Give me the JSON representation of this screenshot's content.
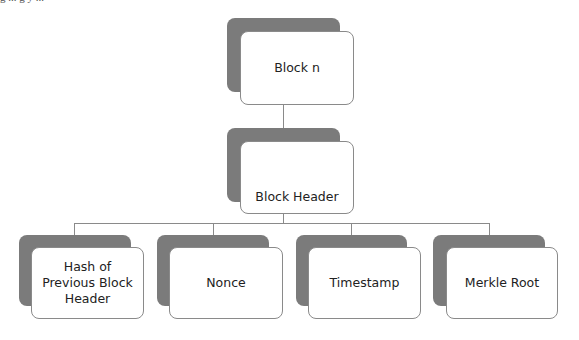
{
  "caption_fragment": "g   ...   g      y   ...",
  "colors": {
    "back_card": "#7b7b7b",
    "front_card": "#ffffff",
    "border": "#8a8a8a",
    "text": "#222222"
  },
  "diagram": {
    "root": {
      "label": "Block n"
    },
    "header": {
      "label": "Block Header"
    },
    "fields": [
      {
        "label": "Hash of Previous Block Header"
      },
      {
        "label": "Nonce"
      },
      {
        "label": "Timestamp"
      },
      {
        "label": "Merkle Root"
      }
    ]
  }
}
